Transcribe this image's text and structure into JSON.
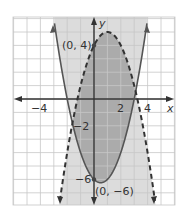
{
  "chart_data": {
    "type": "line",
    "title": "",
    "xlabel": "x",
    "ylabel": "y",
    "xlim": [
      -6,
      6
    ],
    "ylim": [
      -8,
      6
    ],
    "grid": true,
    "x_tick_labels": [
      "-4",
      "2",
      "4"
    ],
    "y_tick_labels": [
      "-2",
      "-6"
    ],
    "series": [
      {
        "name": "y = x^2 - x - 6",
        "style": "solid",
        "equation": "y = x^2 - x - 6",
        "points": [
          [
            -2,
            0
          ],
          [
            0,
            -6
          ],
          [
            0.5,
            -6.25
          ],
          [
            3,
            0
          ]
        ]
      },
      {
        "name": "y = -x^2 + 2x + 4",
        "style": "dashed",
        "equation": "y = -x^2 + 2x + 4",
        "points": [
          [
            -1.24,
            0
          ],
          [
            0,
            4
          ],
          [
            1,
            5
          ],
          [
            3.24,
            0
          ]
        ]
      }
    ],
    "annotations": [
      {
        "text": "(0, 4)",
        "x": 0,
        "y": 4
      },
      {
        "text": "(0, −6)",
        "x": 0,
        "y": -6
      }
    ],
    "shading": "Light gray inside solid parabola region; dark gray where both regions overlap"
  },
  "labels": {
    "x_axis": "x",
    "y_axis": "y",
    "tick_neg4": "−4",
    "tick_2": "2",
    "tick_4": "4",
    "tick_neg2": "−2",
    "tick_neg6": "−6",
    "point_top": "(0, 4)",
    "point_bottom": "(0, −6)"
  },
  "colors": {
    "grid": "#c8c8c8",
    "light_shade": "#d9d9d9",
    "dark_shade": "#a9a9a9",
    "curve": "#555555"
  }
}
